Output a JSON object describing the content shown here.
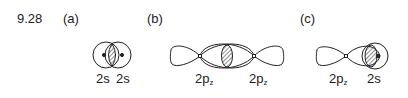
{
  "problem_number": "9.28",
  "parts": [
    {
      "label": "(a)",
      "orbitals": [
        {
          "base": "2s",
          "sub": ""
        },
        {
          "base": "2s",
          "sub": ""
        }
      ]
    },
    {
      "label": "(b)",
      "orbitals": [
        {
          "base": "2p",
          "sub": "z"
        },
        {
          "base": "2p",
          "sub": "z"
        }
      ]
    },
    {
      "label": "(c)",
      "orbitals": [
        {
          "base": "2p",
          "sub": "z"
        },
        {
          "base": "2s",
          "sub": ""
        }
      ]
    }
  ],
  "colors": {
    "stroke": "#222222",
    "background": "#ffffff"
  }
}
